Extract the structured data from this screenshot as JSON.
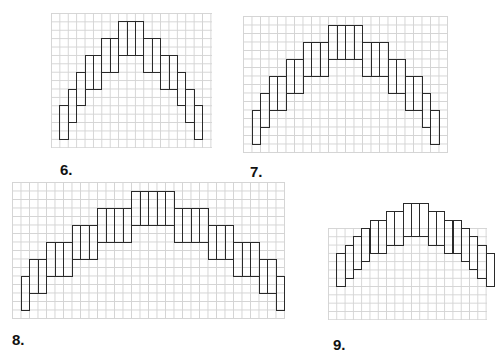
{
  "figures": [
    {
      "label": "6.",
      "grid": {
        "x": 51,
        "y": 13,
        "cols": 19,
        "rows": 16,
        "cell": 8.4
      },
      "rect_height_cells": 4,
      "step_cells": 2,
      "start_col": 1,
      "base_row": 15,
      "column_widths": [
        1,
        1,
        1,
        2,
        2,
        3,
        2,
        2,
        1,
        1,
        1
      ],
      "label_pos": {
        "x": 60,
        "y": 161
      }
    },
    {
      "label": "7.",
      "grid": {
        "x": 243,
        "y": 16,
        "cols": 24,
        "rows": 16,
        "cell": 8.5
      },
      "rect_height_cells": 4,
      "step_cells": 2,
      "start_col": 1,
      "base_row": 15,
      "column_widths": [
        1,
        1,
        2,
        2,
        3,
        4,
        3,
        2,
        2,
        1,
        1
      ],
      "label_pos": {
        "x": 250,
        "y": 163
      }
    },
    {
      "label": "8.",
      "grid": {
        "x": 12,
        "y": 182,
        "cols": 32,
        "rows": 16,
        "cell": 8.5
      },
      "rect_height_cells": 4,
      "step_cells": 2,
      "start_col": 1,
      "base_row": 15,
      "column_widths": [
        1,
        2,
        3,
        3,
        4,
        5,
        4,
        3,
        3,
        2,
        1
      ],
      "label_pos": {
        "x": 12,
        "y": 331
      }
    },
    {
      "label": "9.",
      "grid": {
        "x": 328,
        "y": 228,
        "cols": 19,
        "rows": 11,
        "cell": 8.3
      },
      "rect_height_cells": 4,
      "step_cells": 1,
      "start_col": 1,
      "base_row": 7,
      "column_widths": [
        1,
        1,
        1,
        1,
        2,
        2,
        3,
        2,
        2,
        1,
        1,
        1,
        1
      ],
      "label_pos": {
        "x": 333,
        "y": 336
      }
    }
  ]
}
